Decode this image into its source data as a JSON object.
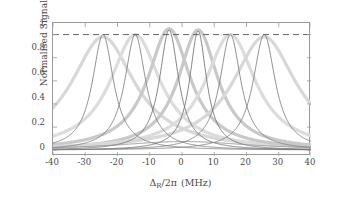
{
  "chart_data": {
    "type": "line",
    "title": "",
    "xlabel": "Δ_R/2π (MHz)",
    "ylabel": "Normalised Signal",
    "xlim": [
      -40,
      40
    ],
    "ylim": [
      -0.05,
      1.1
    ],
    "xticks": [
      -40,
      -30,
      -20,
      -10,
      0,
      10,
      20,
      30,
      40
    ],
    "xticklabels": [
      "-40",
      "-30",
      "-20",
      "-10",
      "0",
      "10",
      "20",
      "30",
      "40"
    ],
    "yticks": [
      0,
      0.2,
      0.4,
      0.6,
      0.8,
      1
    ],
    "yticklabels": [
      "0",
      "0.2",
      "0.4",
      "0.6",
      "0.8",
      "1"
    ],
    "grid": false,
    "legend": null,
    "reference_lines": [
      {
        "name": "unity-normalisation",
        "axis": "y",
        "value": 1,
        "style": "dashed",
        "color": "#555555"
      }
    ],
    "series": [
      {
        "name": "resonance-1",
        "center": -24.5,
        "amplitude": 1.0,
        "hwhm": 4.0,
        "color": "#7d7d7d",
        "band_hwhm": 12.0,
        "band_amplitude": 0.98,
        "band_color": "#d8d8d8"
      },
      {
        "name": "resonance-2",
        "center": -14.5,
        "amplitude": 1.0,
        "hwhm": 4.0,
        "color": "#7d7d7d",
        "band_hwhm": 9.5,
        "band_amplitude": 1.0,
        "band_color": "#dcdcdc"
      },
      {
        "name": "resonance-3",
        "center": -4.0,
        "amplitude": 1.04,
        "hwhm": 3.6,
        "color": "#6f6f6f",
        "band_hwhm": 8.0,
        "band_amplitude": 1.05,
        "band_color": "#c9c9c9"
      },
      {
        "name": "resonance-4",
        "center": 5.0,
        "amplitude": 1.03,
        "hwhm": 3.2,
        "color": "#6f6f6f",
        "band_hwhm": 7.5,
        "band_amplitude": 1.04,
        "band_color": "#c9c9c9"
      },
      {
        "name": "resonance-5",
        "center": 15.0,
        "amplitude": 1.0,
        "hwhm": 4.0,
        "color": "#7d7d7d",
        "band_hwhm": 9.5,
        "band_amplitude": 1.0,
        "band_color": "#dcdcdc"
      },
      {
        "name": "resonance-6",
        "center": 25.5,
        "amplitude": 1.0,
        "hwhm": 4.2,
        "color": "#7d7d7d",
        "band_hwhm": 12.0,
        "band_amplitude": 0.98,
        "band_color": "#d8d8d8"
      },
      {
        "name": "broad-background",
        "center": 0.5,
        "amplitude": 0.075,
        "hwhm": 26.0,
        "color": "#8a8a8a",
        "band_hwhm": 0,
        "band_amplitude": 0,
        "band_color": "#e6e6e6"
      }
    ],
    "central_dip": {
      "position": 0.5,
      "value": 0.68
    },
    "annotations": []
  },
  "axes": {
    "y_label": "Normalised Signal",
    "x_label_delta": "Δ",
    "x_label_sub": "R",
    "x_label_rest": "/2π",
    "x_label_units": "(MHz)"
  }
}
